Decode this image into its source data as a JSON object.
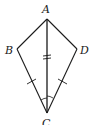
{
  "diagram": {
    "type": "kite",
    "vertices": [
      {
        "label": "A",
        "x": 47,
        "y": 19
      },
      {
        "label": "B",
        "x": 17,
        "y": 49
      },
      {
        "label": "C",
        "x": 47,
        "y": 113
      },
      {
        "label": "D",
        "x": 77,
        "y": 49
      }
    ],
    "segments": [
      "AB",
      "AD",
      "BC",
      "DC",
      "AC"
    ],
    "markings": {
      "AC": "double tick",
      "BC": "single tick",
      "DC": "single tick",
      "angles_at_C": "equal angle arcs (ACB, ACD)"
    },
    "labels": {
      "A": "A",
      "B": "B",
      "C": "C",
      "D": "D"
    },
    "stroke_color": "#1a1a1a"
  }
}
